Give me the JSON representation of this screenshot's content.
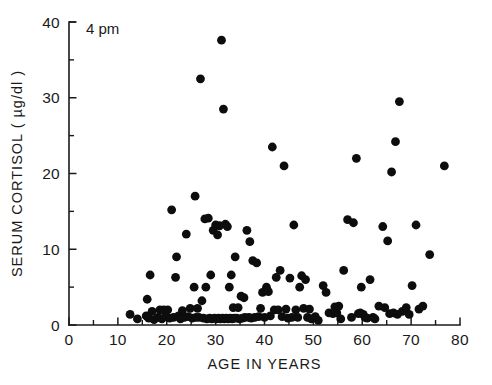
{
  "chart_data": {
    "type": "scatter",
    "title": "",
    "annotation": "4 pm",
    "xlabel": "AGE IN YEARS",
    "ylabel": "SERUM CORTISOL ( µg/dl )",
    "xlim": [
      0,
      80
    ],
    "ylim": [
      0,
      40
    ],
    "x_major_ticks": [
      0,
      10,
      20,
      30,
      40,
      50,
      60,
      70,
      80
    ],
    "x_major_tick_labels": [
      "0",
      "10",
      "20",
      "30",
      "40",
      "50",
      "60",
      "70",
      "80"
    ],
    "x_minor_ticks": [
      5,
      15,
      25,
      35,
      45,
      55,
      65,
      75
    ],
    "y_major_ticks": [
      0,
      10,
      20,
      30,
      40
    ],
    "y_major_tick_labels": [
      "0",
      "10",
      "20",
      "30",
      "40"
    ],
    "y_minor_ticks": [
      5,
      15,
      25,
      35
    ],
    "grid": false,
    "legend": false,
    "marker": "filled-circle",
    "marker_color": "#0d0d0d",
    "marker_size_px": 4.4,
    "axis_color": "#1a1a1a",
    "background_color": "#ffffff",
    "n_points": 152,
    "points": [
      [
        12.5,
        1.4
      ],
      [
        14.0,
        0.8
      ],
      [
        15.8,
        1.2
      ],
      [
        16.0,
        3.4
      ],
      [
        16.3,
        0.9
      ],
      [
        16.6,
        6.6
      ],
      [
        17.0,
        1.8
      ],
      [
        17.4,
        0.7
      ],
      [
        18.2,
        1.0
      ],
      [
        18.6,
        2.0
      ],
      [
        19.0,
        0.8
      ],
      [
        19.4,
        2.0
      ],
      [
        19.8,
        1.1
      ],
      [
        20.2,
        2.0
      ],
      [
        20.6,
        0.9
      ],
      [
        21.0,
        15.2
      ],
      [
        21.4,
        1.0
      ],
      [
        21.8,
        6.3
      ],
      [
        22.0,
        9.0
      ],
      [
        22.4,
        1.2
      ],
      [
        22.8,
        0.8
      ],
      [
        23.2,
        1.9
      ],
      [
        23.6,
        1.0
      ],
      [
        24.0,
        12.0
      ],
      [
        24.4,
        1.1
      ],
      [
        24.8,
        2.2
      ],
      [
        25.2,
        0.9
      ],
      [
        25.6,
        5.0
      ],
      [
        25.8,
        17.0
      ],
      [
        26.0,
        1.0
      ],
      [
        26.3,
        2.2
      ],
      [
        26.6,
        1.0
      ],
      [
        26.9,
        32.5
      ],
      [
        27.2,
        3.2
      ],
      [
        27.5,
        0.9
      ],
      [
        27.8,
        14.0
      ],
      [
        28.0,
        5.0
      ],
      [
        28.2,
        0.8
      ],
      [
        28.5,
        14.1
      ],
      [
        28.8,
        0.9
      ],
      [
        29.0,
        6.6
      ],
      [
        29.2,
        0.8
      ],
      [
        29.5,
        12.5
      ],
      [
        29.8,
        0.9
      ],
      [
        30.0,
        13.2
      ],
      [
        30.2,
        0.8
      ],
      [
        30.4,
        11.9
      ],
      [
        30.6,
        0.9
      ],
      [
        30.8,
        13.1
      ],
      [
        31.0,
        0.8
      ],
      [
        31.2,
        37.6
      ],
      [
        31.4,
        0.9
      ],
      [
        31.6,
        28.5
      ],
      [
        31.8,
        0.8
      ],
      [
        32.0,
        13.3
      ],
      [
        32.2,
        0.9
      ],
      [
        32.4,
        13.0
      ],
      [
        32.6,
        0.8
      ],
      [
        32.8,
        5.0
      ],
      [
        33.0,
        0.9
      ],
      [
        33.2,
        6.6
      ],
      [
        33.4,
        0.8
      ],
      [
        33.6,
        2.3
      ],
      [
        33.8,
        0.9
      ],
      [
        34.0,
        9.0
      ],
      [
        34.3,
        0.9
      ],
      [
        34.6,
        2.3
      ],
      [
        34.9,
        0.8
      ],
      [
        35.2,
        3.8
      ],
      [
        35.5,
        0.9
      ],
      [
        35.8,
        3.6
      ],
      [
        36.0,
        1.0
      ],
      [
        36.4,
        12.5
      ],
      [
        36.8,
        1.0
      ],
      [
        37.0,
        11.0
      ],
      [
        37.3,
        0.9
      ],
      [
        37.6,
        8.5
      ],
      [
        38.0,
        1.0
      ],
      [
        38.4,
        8.2
      ],
      [
        38.8,
        1.1
      ],
      [
        39.2,
        2.2
      ],
      [
        39.6,
        4.3
      ],
      [
        40.0,
        1.0
      ],
      [
        40.4,
        5.0
      ],
      [
        40.8,
        4.4
      ],
      [
        41.2,
        1.2
      ],
      [
        41.6,
        23.5
      ],
      [
        42.0,
        2.0
      ],
      [
        42.4,
        6.3
      ],
      [
        42.8,
        2.0
      ],
      [
        43.2,
        7.2
      ],
      [
        43.6,
        1.1
      ],
      [
        44.0,
        21.0
      ],
      [
        44.4,
        2.1
      ],
      [
        44.8,
        0.9
      ],
      [
        45.2,
        6.2
      ],
      [
        45.6,
        1.0
      ],
      [
        46.0,
        13.2
      ],
      [
        46.4,
        2.0
      ],
      [
        46.8,
        1.0
      ],
      [
        47.2,
        5.0
      ],
      [
        47.6,
        6.5
      ],
      [
        48.0,
        2.2
      ],
      [
        48.4,
        6.0
      ],
      [
        48.8,
        1.0
      ],
      [
        49.2,
        2.1
      ],
      [
        49.6,
        0.8
      ],
      [
        50.4,
        1.1
      ],
      [
        51.0,
        0.6
      ],
      [
        52.0,
        5.2
      ],
      [
        52.6,
        4.3
      ],
      [
        53.2,
        1.6
      ],
      [
        54.0,
        1.5
      ],
      [
        54.4,
        2.4
      ],
      [
        54.8,
        1.6
      ],
      [
        55.2,
        2.5
      ],
      [
        55.6,
        0.8
      ],
      [
        56.2,
        7.2
      ],
      [
        57.0,
        13.9
      ],
      [
        57.8,
        1.0
      ],
      [
        58.2,
        13.5
      ],
      [
        58.8,
        22.0
      ],
      [
        59.2,
        1.5
      ],
      [
        59.6,
        1.6
      ],
      [
        59.8,
        5.0
      ],
      [
        60.2,
        1.4
      ],
      [
        60.6,
        1.0
      ],
      [
        61.0,
        0.9
      ],
      [
        61.6,
        6.0
      ],
      [
        62.2,
        1.0
      ],
      [
        62.6,
        0.8
      ],
      [
        63.4,
        2.5
      ],
      [
        64.2,
        13.0
      ],
      [
        64.6,
        2.3
      ],
      [
        65.2,
        11.1
      ],
      [
        65.6,
        1.5
      ],
      [
        66.0,
        20.2
      ],
      [
        66.4,
        1.6
      ],
      [
        66.8,
        24.2
      ],
      [
        67.2,
        1.4
      ],
      [
        67.6,
        29.5
      ],
      [
        68.2,
        1.8
      ],
      [
        69.0,
        2.3
      ],
      [
        69.6,
        1.4
      ],
      [
        70.2,
        5.2
      ],
      [
        71.0,
        13.2
      ],
      [
        71.6,
        2.1
      ],
      [
        72.4,
        2.5
      ],
      [
        73.8,
        9.3
      ],
      [
        76.8,
        21.0
      ]
    ]
  }
}
